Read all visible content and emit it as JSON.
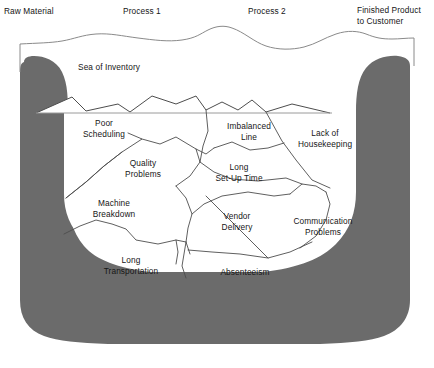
{
  "figure": {
    "title": "Sea of Inventory",
    "kind": "iceberg-sea-of-inventory-diagram",
    "colors": {
      "seabed_gray": "#6b6b6b",
      "line": "#4d4d4d",
      "water_line": "#8a8a8a",
      "text": "#161616",
      "background": "#ffffff"
    }
  },
  "flow_headers": [
    {
      "id": "raw-material",
      "label": "Raw Material",
      "x": 4,
      "y": 6
    },
    {
      "id": "process-1",
      "label": "Process 1",
      "x": 123,
      "y": 6
    },
    {
      "id": "process-2",
      "label": "Process 2",
      "x": 248,
      "y": 6
    },
    {
      "id": "finished-product",
      "label": "Finished Product\nto Customer",
      "x": 357,
      "y": 5
    }
  ],
  "sea": {
    "label": "Sea of Inventory",
    "x": 78,
    "y": 62
  },
  "problems": [
    {
      "id": "poor-scheduling",
      "label": "Poor\nScheduling",
      "x": 104,
      "y": 118
    },
    {
      "id": "imbalanced-line",
      "label": "Imbalanced\nLine",
      "x": 249,
      "y": 121
    },
    {
      "id": "lack-of-housekeeping",
      "label": "Lack of\nHousekeeping",
      "x": 325,
      "y": 128
    },
    {
      "id": "quality-problems",
      "label": "Quality\nProblems",
      "x": 143,
      "y": 158
    },
    {
      "id": "long-set-up-time",
      "label": "Long\nSet-Up Time",
      "x": 239,
      "y": 162
    },
    {
      "id": "machine-breakdown",
      "label": "Machine\nBreakdown",
      "x": 114,
      "y": 198
    },
    {
      "id": "vendor-delivery",
      "label": "Vendor\nDelivery",
      "x": 237,
      "y": 211
    },
    {
      "id": "communication-problems",
      "label": "Communication\nProblems",
      "x": 323,
      "y": 216
    },
    {
      "id": "long-transportation",
      "label": "Long\nTransportation",
      "x": 131,
      "y": 255
    },
    {
      "id": "absenteeism",
      "label": "Absenteeism",
      "x": 245,
      "y": 267
    }
  ],
  "caption": {
    "text": ""
  }
}
